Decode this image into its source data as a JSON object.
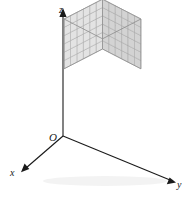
{
  "figure": {
    "type": "3d-coordinate-axes-with-cube-stack",
    "background_color": "#ffffff",
    "axes": {
      "origin_label": "O",
      "x_label": "x",
      "y_label": "y",
      "z_label": "z",
      "line_color": "#1a1a1a",
      "arrowheads": [
        "x",
        "y",
        "z"
      ]
    },
    "cube": {
      "divisions_x": 6,
      "divisions_y": 6,
      "divisions_z": 6,
      "total_small_cubes": 216,
      "top_face_color": "#f2f2f2",
      "left_face_color": "#e3e3e3",
      "right_face_color": "#d3d3d3",
      "grid_line_color": "#9a9a9a",
      "outline_color": "#8c8c8c"
    },
    "shadow": {
      "color": "#f0f0f0"
    }
  }
}
